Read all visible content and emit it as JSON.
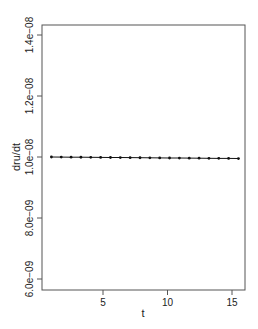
{
  "chart_data": {
    "type": "line",
    "title": "",
    "xlabel": "t",
    "ylabel": "dru/dt",
    "xlim": [
      0.3,
      16.0
    ],
    "ylim": [
      5.7e-09,
      1.44e-08
    ],
    "x_ticks": [
      5,
      10,
      15
    ],
    "x_tick_labels": [
      "5",
      "10",
      "15"
    ],
    "y_ticks": [
      6e-09,
      8e-09,
      1e-08,
      1.2e-08,
      1.4e-08
    ],
    "y_tick_labels": [
      "6.0e−09",
      "8.0e−09",
      "1.0e−08",
      "1.2e−08",
      "1.4e−08"
    ],
    "grid": false,
    "legend": null,
    "series": [
      {
        "name": "dru/dt",
        "style": "points and lines (type='o'), black",
        "x": [
          1.0,
          1.763,
          2.526,
          3.289,
          4.053,
          4.816,
          5.579,
          6.342,
          7.105,
          7.868,
          8.632,
          9.395,
          10.158,
          10.921,
          11.684,
          12.447,
          13.211,
          13.974,
          14.737,
          15.5
        ],
        "values": [
          1e-08,
          9.997e-09,
          9.995e-09,
          9.992e-09,
          9.989e-09,
          9.987e-09,
          9.984e-09,
          9.982e-09,
          9.979e-09,
          9.976e-09,
          9.974e-09,
          9.971e-09,
          9.968e-09,
          9.966e-09,
          9.963e-09,
          9.961e-09,
          9.958e-09,
          9.955e-09,
          9.953e-09,
          9.95e-09
        ]
      }
    ]
  },
  "colors": {
    "axis": "#444444",
    "series": "#111111",
    "background": "#ffffff"
  }
}
